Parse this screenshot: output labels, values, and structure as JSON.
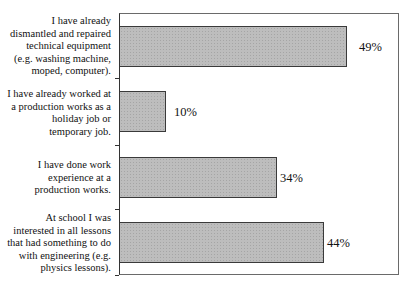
{
  "chart_data": {
    "type": "bar",
    "orientation": "horizontal",
    "title": "",
    "xlabel": "",
    "ylabel": "",
    "xlim": [
      0,
      60
    ],
    "grid": false,
    "legend": null,
    "categories": [
      "I have already dismantled and repaired technical equipment (e.g. washing machine, moped, computer).",
      "I have already worked at a production works as a holiday job or temporary job.",
      "I have done work experience at a production works.",
      "At school I was interested in all lessons that had something to do with engineering (e.g. physics lessons)."
    ],
    "values": [
      49,
      10,
      34,
      44
    ],
    "value_labels": [
      "49%",
      "10%",
      "34%",
      "44%"
    ],
    "unit": "%"
  },
  "labels": {
    "cat0": [
      "I have already",
      "dismantled and repaired",
      "technical equipment",
      "(e.g. washing machine,",
      "moped, computer)."
    ],
    "cat1": [
      "I have already worked at",
      "a production works as a",
      "holiday job or",
      "temporary job."
    ],
    "cat2": [
      "I have done work",
      "experience at a",
      "production works."
    ],
    "cat3": [
      "At school I was",
      "interested in all lessons",
      "that had something to do",
      "with engineering (e.g.",
      "physics lessons)."
    ]
  },
  "colors": {
    "bar_fill": "#bdbdbd",
    "bar_border": "#3a3a3a",
    "frame": "#6a6a6a"
  }
}
